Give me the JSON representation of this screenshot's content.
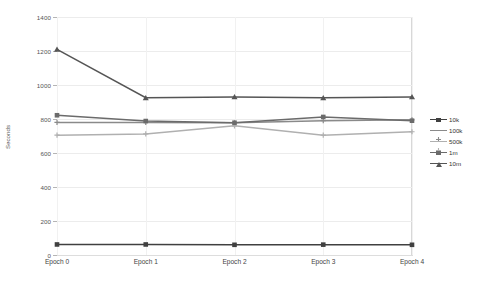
{
  "chart_data": {
    "type": "line",
    "title": "",
    "xlabel": "",
    "ylabel": "Seconds",
    "categories": [
      "Epoch 0",
      "Epoch 1",
      "Epoch 2",
      "Epoch 3",
      "Epoch 4"
    ],
    "ylim": [
      0,
      1400
    ],
    "yticks": [
      0,
      200,
      400,
      600,
      800,
      1000,
      1200,
      1400
    ],
    "grid": true,
    "legend_position": "right",
    "series": [
      {
        "name": "10k",
        "values": [
          62,
          62,
          60,
          61,
          60
        ],
        "color": "#404040",
        "marker": "square"
      },
      {
        "name": "100k",
        "values": [
          780,
          780,
          778,
          790,
          795
        ],
        "color": "#8a8a8a",
        "marker": "plus"
      },
      {
        "name": "500k",
        "values": [
          705,
          712,
          760,
          705,
          725
        ],
        "color": "#b0b0b0",
        "marker": "plus"
      },
      {
        "name": "1m",
        "values": [
          822,
          788,
          778,
          812,
          790
        ],
        "color": "#6b6b6b",
        "marker": "square"
      },
      {
        "name": "10m",
        "values": [
          1210,
          925,
          930,
          925,
          930
        ],
        "color": "#555555",
        "marker": "triangle"
      }
    ]
  },
  "axis": {
    "y_tick_labels": [
      "0",
      "200",
      "400",
      "600",
      "800",
      "1000",
      "1200",
      "1400"
    ],
    "y_axis_title": "Seconds",
    "x_tick_labels": [
      "Epoch 0",
      "Epoch 1",
      "Epoch 2",
      "Epoch 3",
      "Epoch 4"
    ]
  },
  "legend": {
    "entries": [
      {
        "label": "10k"
      },
      {
        "label": "100k"
      },
      {
        "label": "500k"
      },
      {
        "label": "1m"
      },
      {
        "label": "10m"
      }
    ]
  },
  "colors": {
    "gridline": "#ececec",
    "axis": "#c9c9c9",
    "background": "#ffffff",
    "text": "#444444"
  }
}
